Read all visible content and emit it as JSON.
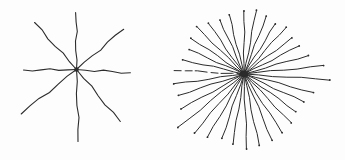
{
  "page": {
    "background_color": "#fdfdfd",
    "ink_color": "#2b2b2b"
  },
  "figures": [
    {
      "id": "left-star",
      "description": "hand-drawn asterisk of 8 radiating wavy lines crossing at a small dark center dot",
      "center": {
        "x": 76.5,
        "y": 69.5
      },
      "center_marker": "square",
      "center_marker_size": 4,
      "stroke_width": 1.1,
      "waviness_amp": 1.3,
      "waviness_cycles": 1.8,
      "tip_dots": false,
      "ray_count": 8,
      "rays": [
        {
          "angle": -90.5,
          "length": 57
        },
        {
          "angle": -40.7,
          "length": 62
        },
        {
          "angle": 3.7,
          "length": 54
        },
        {
          "angle": 50,
          "length": 68
        },
        {
          "angle": 88.5,
          "length": 72
        },
        {
          "angle": 141.5,
          "length": 71
        },
        {
          "angle": 179.2,
          "length": 53
        },
        {
          "angle": -131.8,
          "length": 63
        }
      ]
    },
    {
      "id": "right-star",
      "description": "hand-drawn starburst of 34 radiating lines converging to a dense dark center blob",
      "center": {
        "x": 244,
        "y": 74
      },
      "center_marker": "blob",
      "center_marker_size": 7,
      "stroke_width": 1.0,
      "waviness_amp": 0.8,
      "waviness_cycles": 1.5,
      "tip_dots": true,
      "ray_count": 34,
      "rays": [
        {
          "angle": -90,
          "length": 63
        },
        {
          "angle": -79,
          "length": 65
        },
        {
          "angle": -69,
          "length": 62
        },
        {
          "angle": -58,
          "length": 59
        },
        {
          "angle": -48,
          "length": 63
        },
        {
          "angle": -37,
          "length": 60
        },
        {
          "angle": -27,
          "length": 62
        },
        {
          "angle": -16,
          "length": 67
        },
        {
          "angle": -6,
          "length": 80
        },
        {
          "angle": 4,
          "length": 86
        },
        {
          "angle": 15,
          "length": 72
        },
        {
          "angle": 25,
          "length": 66
        },
        {
          "angle": 36,
          "length": 64
        },
        {
          "angle": 46,
          "length": 68
        },
        {
          "angle": 57,
          "length": 70
        },
        {
          "angle": 67,
          "length": 72
        },
        {
          "angle": 78,
          "length": 73
        },
        {
          "angle": 88,
          "length": 75
        },
        {
          "angle": 99,
          "length": 71
        },
        {
          "angle": 109,
          "length": 68
        },
        {
          "angle": 120,
          "length": 73
        },
        {
          "angle": 130,
          "length": 77
        },
        {
          "angle": 141,
          "length": 85
        },
        {
          "angle": 151,
          "length": 72
        },
        {
          "angle": 162,
          "length": 69
        },
        {
          "angle": 172,
          "length": 71
        },
        {
          "angle": -177,
          "length": 70,
          "dashed": true
        },
        {
          "angle": -167,
          "length": 63
        },
        {
          "angle": -156,
          "length": 60
        },
        {
          "angle": -146,
          "length": 64
        },
        {
          "angle": -135,
          "length": 67
        },
        {
          "angle": -125,
          "length": 62
        },
        {
          "angle": -114,
          "length": 59
        },
        {
          "angle": -104,
          "length": 61
        }
      ]
    }
  ]
}
